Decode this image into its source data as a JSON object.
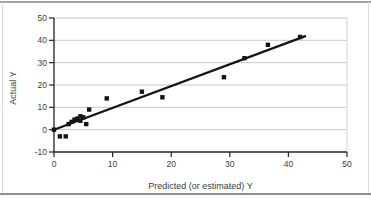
{
  "page": {
    "background": "#ffffff",
    "rule_color_top": "#a3a3a3",
    "rule_color_bottom": "#8f8f8f",
    "side_border_color": "#dcdcdc"
  },
  "chart_data": {
    "type": "scatter",
    "title": "",
    "xlabel": "Predicted (or estimated) Y",
    "ylabel": "Actual Y",
    "xlim": [
      0,
      50
    ],
    "ylim": [
      -10,
      50
    ],
    "x_ticks": [
      0,
      10,
      20,
      30,
      40,
      50
    ],
    "y_ticks": [
      -10,
      0,
      10,
      20,
      30,
      40,
      50
    ],
    "grid_lines_y": [
      0,
      10,
      20,
      30,
      40,
      50
    ],
    "grid": "horizontal-only",
    "legend": "none",
    "marker": "square",
    "points": [
      [
        0,
        0
      ],
      [
        1,
        -3
      ],
      [
        2,
        -3
      ],
      [
        2.5,
        2.5
      ],
      [
        3,
        3.5
      ],
      [
        3.5,
        4.5
      ],
      [
        4,
        5
      ],
      [
        4.5,
        6
      ],
      [
        4.5,
        4
      ],
      [
        5,
        5.5
      ],
      [
        5.5,
        2.5
      ],
      [
        6,
        9
      ],
      [
        9,
        14
      ],
      [
        15,
        17
      ],
      [
        18.5,
        14.5
      ],
      [
        29,
        23.5
      ],
      [
        32.5,
        32
      ],
      [
        36.5,
        38
      ],
      [
        42,
        41.5
      ]
    ],
    "trendline": {
      "x1": 0,
      "y1": 0,
      "x2": 43,
      "y2": 42
    },
    "colors": {
      "marker": "#141414",
      "trend": "#141414",
      "axis": "#232323",
      "grid": "#c9c9c9",
      "frame": "#d4d4d4",
      "text": "#3c3c3c"
    }
  }
}
